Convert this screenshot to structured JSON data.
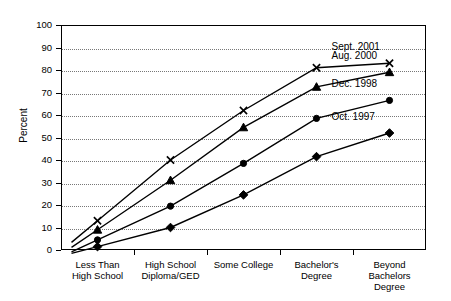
{
  "chart_data": {
    "type": "line",
    "title": "",
    "xlabel": "",
    "ylabel": "Percent",
    "ylim": [
      0,
      100
    ],
    "ytick_step": 10,
    "grid": true,
    "legend_position": "right-inline-end-of-line",
    "categories": [
      "Less Than\nHigh School",
      "High School\nDiploma/GED",
      "Some College",
      "Bachelor's\nDegree",
      "Beyond\nBachelors\nDegree"
    ],
    "yticks": [
      "0",
      "10",
      "20",
      "30",
      "40",
      "50",
      "60",
      "70",
      "80",
      "90",
      "100"
    ],
    "series": [
      {
        "name": "Sept. 2001",
        "marker": "x",
        "values": [
          13,
          40,
          62,
          81,
          83
        ]
      },
      {
        "name": "Aug. 2000",
        "marker": "triangle",
        "values": [
          9,
          31,
          54.5,
          72.5,
          79
        ]
      },
      {
        "name": "Dec. 1998",
        "marker": "circle",
        "values": [
          4.5,
          19.5,
          38.5,
          58.5,
          66.5
        ]
      },
      {
        "name": "Oct. 1997",
        "marker": "diamond",
        "values": [
          1.5,
          10,
          24.5,
          41.5,
          52
        ]
      }
    ]
  }
}
